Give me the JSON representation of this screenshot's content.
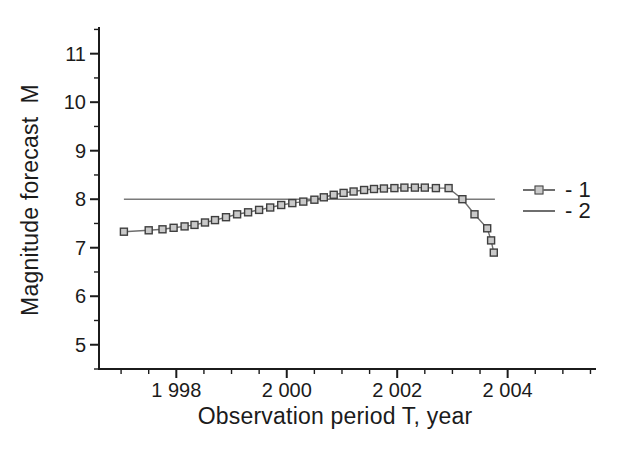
{
  "figure": {
    "background": "#ffffff",
    "axis_color": "#1b1b1b",
    "text_color": "#1b1b1b"
  },
  "chart_data": {
    "type": "line",
    "title": "",
    "xlabel": "Observation period T, year",
    "ylabel": "Magnitude forecast  M",
    "xlim": [
      1996.6,
      2005.6
    ],
    "ylim": [
      4.5,
      11.55
    ],
    "grid": false,
    "legend_position": "right-middle",
    "x_major_ticks": [
      {
        "value": 1998,
        "label": "1 998"
      },
      {
        "value": 2000,
        "label": "2 000"
      },
      {
        "value": 2002,
        "label": "2 002"
      },
      {
        "value": 2004,
        "label": "2 004"
      }
    ],
    "x_minor_tick_step": 0.5,
    "y_major_ticks": [
      {
        "value": 5,
        "label": "5"
      },
      {
        "value": 6,
        "label": "6"
      },
      {
        "value": 7,
        "label": "7"
      },
      {
        "value": 8,
        "label": "8"
      },
      {
        "value": 9,
        "label": "9"
      },
      {
        "value": 10,
        "label": "10"
      },
      {
        "value": 11,
        "label": "11"
      }
    ],
    "y_minor_tick_step": 0.5,
    "series": [
      {
        "name": "2",
        "legend_label": "- 2",
        "marker": "none",
        "color": "#7a7a7a",
        "line_width": 1.6,
        "points": [
          [
            1997.05,
            8.0
          ],
          [
            2003.77,
            8.0
          ]
        ]
      },
      {
        "name": "1",
        "legend_label": "- 1",
        "marker": "square",
        "color": "#6e6e6e",
        "marker_fill": "#c9c9c9",
        "marker_stroke": "#3f3f3f",
        "line_width": 1.4,
        "points": [
          [
            1997.05,
            7.33
          ],
          [
            1997.5,
            7.36
          ],
          [
            1997.75,
            7.38
          ],
          [
            1997.95,
            7.41
          ],
          [
            1998.15,
            7.44
          ],
          [
            1998.33,
            7.47
          ],
          [
            1998.52,
            7.52
          ],
          [
            1998.7,
            7.57
          ],
          [
            1998.9,
            7.63
          ],
          [
            1999.1,
            7.69
          ],
          [
            1999.3,
            7.73
          ],
          [
            1999.5,
            7.78
          ],
          [
            1999.7,
            7.83
          ],
          [
            1999.9,
            7.88
          ],
          [
            2000.1,
            7.92
          ],
          [
            2000.3,
            7.95
          ],
          [
            2000.5,
            7.99
          ],
          [
            2000.67,
            8.04
          ],
          [
            2000.85,
            8.09
          ],
          [
            2001.03,
            8.13
          ],
          [
            2001.21,
            8.16
          ],
          [
            2001.4,
            8.19
          ],
          [
            2001.58,
            8.21
          ],
          [
            2001.76,
            8.22
          ],
          [
            2001.95,
            8.23
          ],
          [
            2002.13,
            8.24
          ],
          [
            2002.32,
            8.24
          ],
          [
            2002.5,
            8.24
          ],
          [
            2002.7,
            8.23
          ],
          [
            2002.93,
            8.23
          ],
          [
            2003.18,
            8.0
          ],
          [
            2003.4,
            7.69
          ],
          [
            2003.63,
            7.4
          ],
          [
            2003.7,
            7.15
          ],
          [
            2003.75,
            6.9
          ]
        ]
      }
    ]
  },
  "legend": {
    "entries": [
      {
        "label": "- 1",
        "swatch": "line-with-square-marker-icon"
      },
      {
        "label": "- 2",
        "swatch": "line-icon"
      }
    ]
  }
}
